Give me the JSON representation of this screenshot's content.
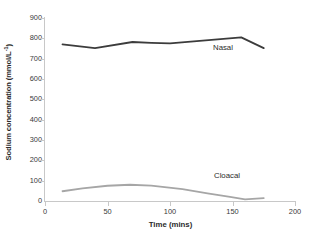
{
  "chart_data": {
    "type": "line",
    "title": "",
    "xlabel": "Time (mins)",
    "ylabel": "Sodium concentration (mmol/L⁻¹)",
    "ylabel_main": "Sodium concentration (mmol/L",
    "ylabel_sup": "-1",
    "ylabel_tail": ")",
    "xlim": [
      0,
      200
    ],
    "ylim": [
      0,
      900
    ],
    "grid": false,
    "legend_position": "inline-annotations",
    "xticks": [
      0,
      50,
      100,
      150,
      200
    ],
    "xtick_labels": [
      "0",
      "50",
      "100",
      "150",
      "200"
    ],
    "yticks": [
      0,
      100,
      200,
      300,
      400,
      500,
      600,
      700,
      800,
      900
    ],
    "ytick_labels": [
      "0",
      "100",
      "200",
      "300",
      "400",
      "500",
      "600",
      "700",
      "800",
      "900"
    ],
    "series": [
      {
        "name": "Nasal",
        "color": "#3c3c3c",
        "line_width": 1.8,
        "annotation_label": "Nasal",
        "x": [
          14,
          40,
          70,
          85,
          100,
          157,
          175
        ],
        "values": [
          770,
          752,
          782,
          778,
          775,
          805,
          752
        ]
      },
      {
        "name": "Cloacal",
        "color": "#a6a6a6",
        "line_width": 1.8,
        "annotation_label": "Cloacal",
        "x": [
          14,
          30,
          50,
          68,
          85,
          110,
          130,
          148,
          160,
          175
        ],
        "values": [
          48,
          62,
          75,
          80,
          76,
          58,
          38,
          20,
          8,
          14
        ]
      }
    ]
  },
  "axes": {
    "y_axis_color": "#c8c8c8",
    "x_axis_color": "#c8c8c8",
    "tick_color": "#c8c8c8",
    "tick_label_color": "#3a3a3a",
    "title_color": "#2b2b2b"
  }
}
